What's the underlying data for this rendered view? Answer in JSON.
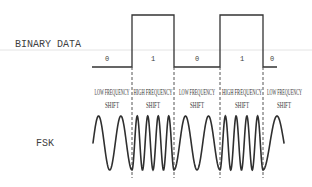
{
  "diagram": {
    "binary_data_label": "BINARY DATA",
    "fsk_label": "FSK",
    "segments": [
      {
        "bit": "0",
        "shift_line1": "LOW FREQUENCY",
        "shift_line2": "SHIFT",
        "frequency": "low",
        "cycles": 1.75
      },
      {
        "bit": "1",
        "shift_line1": "HIGH FREQUENCY",
        "shift_line2": "SHIFT",
        "frequency": "high",
        "cycles": 4
      },
      {
        "bit": "0",
        "shift_line1": "LOW FREQUENCY",
        "shift_line2": "SHIFT",
        "frequency": "low",
        "cycles": 2
      },
      {
        "bit": "1",
        "shift_line1": "HIGH FREQUENCY",
        "shift_line2": "SHIFT",
        "frequency": "high",
        "cycles": 4
      },
      {
        "bit": "0",
        "shift_line1": "LOW FREQUENCY",
        "shift_line2": "SHIFT",
        "frequency": "low",
        "cycles": 0.75
      }
    ],
    "colors": {
      "line": "#333333",
      "text": "#3e3e3e",
      "background": "#ffffff"
    }
  }
}
